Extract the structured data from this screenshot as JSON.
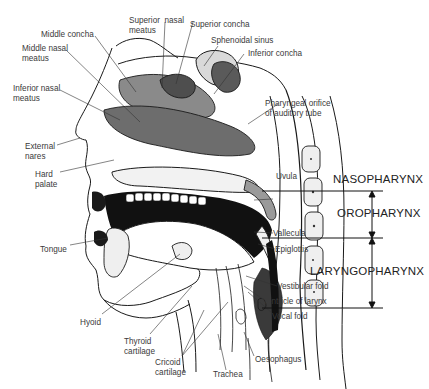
{
  "figure": {
    "type": "sagittal section of head and neck",
    "labels": {
      "superior_nasal_meatus": "Superior  nasal\nmeatus",
      "superior_concha": "Superior concha",
      "middle_concha": "Middle concha",
      "sphenoidal_sinus": "Sphenoidal sinus",
      "middle_nasal_meatus": "Middle nasal\nmeatus",
      "inferior_concha": "Inferior concha",
      "inferior_nasal_meatus": "Inferior nasal\nmeatus",
      "pharyngeal_orifice": "Pharyngeal orifice\nof auditory tube",
      "external_nares": "External\nnares",
      "hard_palate": "Hard\npalate",
      "uvula": "Uvula",
      "vallecula": "Vallecula",
      "epiglottis": "Epiglottis",
      "tongue": "Tongue",
      "vestibular_fold": "Vestibular fold",
      "ventricle_of_larynx": "Ventricle of larynx",
      "vocal_fold": "Vocal fold",
      "hyoid": "Hyoid",
      "thyroid_cartilage": "Thyroid\ncartilage",
      "cricoid_cartilage": "Cricoid\ncartilage",
      "trachea": "Trachea",
      "oesophagus": "Oesophagus"
    },
    "regions": {
      "nasopharynx": "NASOPHARYNX",
      "oropharynx": "OROPHARYNX",
      "laryngopharynx": "LARYNGOPHARYNX"
    }
  }
}
